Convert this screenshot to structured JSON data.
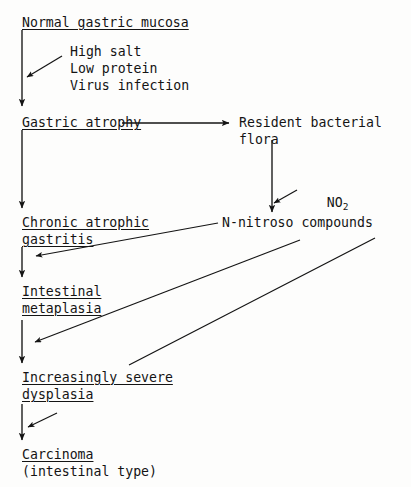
{
  "diagram": {
    "background_color": "#fdfdfc",
    "ink_color": "#141414",
    "nodes": {
      "normal_mucosa": "Normal gastric mucosa",
      "gastric_atrophy": "Gastric atrophy",
      "resident_flora_line1": "Resident bacterial",
      "resident_flora_line2": "flora",
      "chronic_gastritis_line1": "Chronic atrophic",
      "chronic_gastritis_line2": "gastritis",
      "n_nitroso": "N-nitroso compounds",
      "intestinal_metaplasia_line1": "Intestinal",
      "intestinal_metaplasia_line2": "metaplasia",
      "dysplasia_line1": "Increasingly severe",
      "dysplasia_line2": "dysplasia",
      "carcinoma": "Carcinoma",
      "carcinoma_subtitle": "(intestinal type)"
    },
    "risk_factors": {
      "line1": "High salt",
      "line2": "Low protein",
      "line3": "Virus infection"
    },
    "labels": {
      "no2_formula": "NO",
      "no2_subscript": "2"
    }
  }
}
